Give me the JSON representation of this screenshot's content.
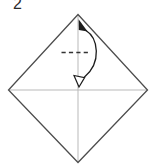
{
  "figure": {
    "kind": "origami-instruction-step",
    "background": "#ffffff"
  },
  "step": {
    "number": "2"
  },
  "colors": {
    "paper_outline": "#4d4d4d",
    "crease": "#b9b9b9",
    "fold_dash": "#333333",
    "arrow": "#1c1c1c",
    "arrowhead_open_fill": "#ffffff",
    "step_label": "#2b2b2b"
  },
  "paper": {
    "outline_points": "78,14.5 147.5,90 78,162.5 8.5,90"
  },
  "creases": {
    "horizontal": {
      "x1": "9",
      "y1": "90",
      "x2": "147",
      "y2": "90"
    },
    "vertical": {
      "x1": "78",
      "y1": "15.5",
      "x2": "78",
      "y2": "161.5"
    }
  },
  "fold_line": {
    "x1": "61.5",
    "y1": "52.5",
    "x2": "90",
    "y2": "52.5",
    "dasharray": "4.2 3.2"
  },
  "fold_arrow": {
    "type": "fold-and-unfold",
    "curve_path": "M 86 30.5 C 98 38, 102 62, 84.5 77",
    "filled_head_path": "M 78.6 19.2 L 87.6 31.6 L 78.8 30 Z",
    "open_head_path": "M 79 87 L 74 75.5 L 84.6 77.6 Z"
  }
}
